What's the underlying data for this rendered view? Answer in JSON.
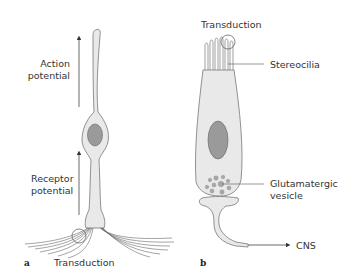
{
  "panel_a": {
    "letter": "a",
    "labels": {
      "action_potential_line1": "Action",
      "action_potential_line2": "potential",
      "receptor_potential_line1": "Receptor",
      "receptor_potential_line2": "potential",
      "transduction": "Transduction"
    }
  },
  "panel_b": {
    "letter": "b",
    "labels": {
      "transduction": "Transduction",
      "stereocilia": "Stereocilia",
      "glutamatergic_line1": "Glutamatergic",
      "glutamatergic_line2": "vesicle",
      "cns": "CNS"
    }
  },
  "colors": {
    "cell_fill": "#e9e9e9",
    "cell_stroke": "#777777",
    "nucleus_fill": "#9a9a9a",
    "vesicle_fill": "#a8a8a8",
    "arrow": "#444444"
  }
}
